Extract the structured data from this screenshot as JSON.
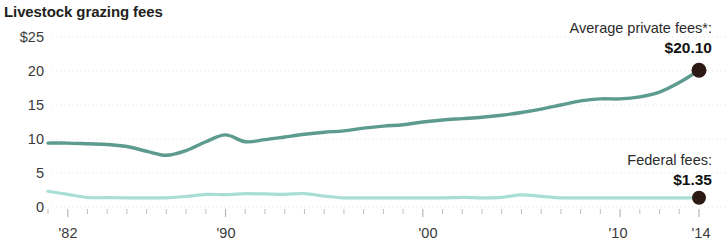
{
  "chart_data": {
    "type": "line",
    "title": "Livestock grazing fees",
    "xlabel": "",
    "ylabel": "",
    "ylim": [
      0,
      25
    ],
    "xlim": [
      1981,
      2014
    ],
    "grid": true,
    "y_ticks": [
      "$25",
      "20",
      "15",
      "10",
      "5",
      "0"
    ],
    "y_tick_values": [
      25,
      20,
      15,
      10,
      5,
      0
    ],
    "x_ticks": [
      "'82",
      "'90",
      "'00",
      "'10",
      "'14"
    ],
    "x_tick_values": [
      1982,
      1990,
      2000,
      2010,
      2014
    ],
    "legend_position": "inline-annotations",
    "series": [
      {
        "name": "Average private fees*",
        "color": "#5d9b8f",
        "end_label": "Average private fees*:",
        "end_value_label": "$20.10",
        "end_value": 20.1,
        "x": [
          1981,
          1982,
          1983,
          1984,
          1985,
          1986,
          1987,
          1988,
          1989,
          1990,
          1991,
          1992,
          1993,
          1994,
          1995,
          1996,
          1997,
          1998,
          1999,
          2000,
          2001,
          2002,
          2003,
          2004,
          2005,
          2006,
          2007,
          2008,
          2009,
          2010,
          2011,
          2012,
          2013,
          2014
        ],
        "values": [
          9.4,
          9.4,
          9.3,
          9.2,
          8.9,
          8.2,
          7.6,
          8.3,
          9.6,
          10.6,
          9.6,
          9.9,
          10.3,
          10.7,
          11.0,
          11.2,
          11.6,
          11.9,
          12.1,
          12.5,
          12.8,
          13.0,
          13.2,
          13.5,
          13.9,
          14.4,
          15.0,
          15.6,
          15.9,
          15.9,
          16.2,
          16.9,
          18.3,
          20.1
        ]
      },
      {
        "name": "Federal fees",
        "color": "#a8ded3",
        "end_label": "Federal fees:",
        "end_value_label": "$1.35",
        "end_value": 1.35,
        "x": [
          1981,
          1982,
          1983,
          1984,
          1985,
          1986,
          1987,
          1988,
          1989,
          1990,
          1991,
          1992,
          1993,
          1994,
          1995,
          1996,
          1997,
          1998,
          1999,
          2000,
          2001,
          2002,
          2003,
          2004,
          2005,
          2006,
          2007,
          2008,
          2009,
          2010,
          2011,
          2012,
          2013,
          2014
        ],
        "values": [
          2.31,
          1.86,
          1.4,
          1.37,
          1.35,
          1.35,
          1.35,
          1.54,
          1.86,
          1.81,
          1.97,
          1.92,
          1.86,
          1.98,
          1.61,
          1.35,
          1.35,
          1.35,
          1.35,
          1.35,
          1.35,
          1.43,
          1.35,
          1.43,
          1.79,
          1.56,
          1.35,
          1.35,
          1.35,
          1.35,
          1.35,
          1.35,
          1.35,
          1.35
        ]
      }
    ]
  },
  "axis": {
    "y_labels": [
      "$25",
      "20",
      "15",
      "10",
      "5",
      "0"
    ],
    "x_labels": [
      "'82",
      "'90",
      "'00",
      "'10",
      "'14"
    ]
  },
  "annotations": {
    "private": {
      "label": "Average private fees*:",
      "value": "$20.10"
    },
    "federal": {
      "label": "Federal fees:",
      "value": "$1.35"
    }
  },
  "colors": {
    "private_line": "#5d9b8f",
    "federal_line": "#a8ded3",
    "endpoint_dot": "#2e1a14",
    "gridline": "#e2e2e2",
    "text": "#231f20"
  }
}
